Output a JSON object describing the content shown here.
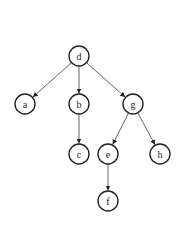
{
  "diagram": {
    "type": "tree",
    "nodes": [
      {
        "id": "d",
        "label": "d",
        "x": 79,
        "y": 56
      },
      {
        "id": "a",
        "label": "a",
        "x": 25,
        "y": 104
      },
      {
        "id": "b",
        "label": "b",
        "x": 79,
        "y": 104
      },
      {
        "id": "g",
        "label": "g",
        "x": 133,
        "y": 104
      },
      {
        "id": "c",
        "label": "c",
        "x": 79,
        "y": 154
      },
      {
        "id": "e",
        "label": "e",
        "x": 108,
        "y": 154
      },
      {
        "id": "h",
        "label": "h",
        "x": 160,
        "y": 154
      },
      {
        "id": "f",
        "label": "f",
        "x": 108,
        "y": 201
      }
    ],
    "edges": [
      {
        "from": "d",
        "to": "a"
      },
      {
        "from": "d",
        "to": "b"
      },
      {
        "from": "d",
        "to": "g"
      },
      {
        "from": "b",
        "to": "c"
      },
      {
        "from": "g",
        "to": "e"
      },
      {
        "from": "g",
        "to": "h"
      },
      {
        "from": "e",
        "to": "f"
      }
    ],
    "node_radius": 10,
    "colors": {
      "stroke": "#222222",
      "edge": "#555555",
      "background": "#ffffff"
    }
  }
}
